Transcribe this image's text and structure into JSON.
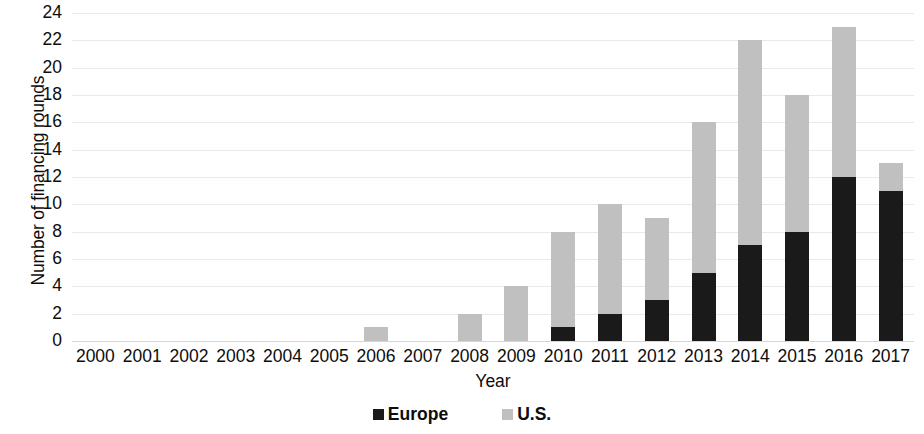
{
  "chart_data": {
    "type": "bar",
    "subtype": "stacked-bar",
    "title": "",
    "xlabel": "Year",
    "ylabel": "Number of financing rounds",
    "categories": [
      "2000",
      "2001",
      "2002",
      "2003",
      "2004",
      "2005",
      "2006",
      "2007",
      "2008",
      "2009",
      "2010",
      "2011",
      "2012",
      "2013",
      "2014",
      "2015",
      "2016",
      "2017"
    ],
    "series": [
      {
        "name": "Europe",
        "color": "#1a1a1a",
        "values": [
          0,
          0,
          0,
          0,
          0,
          0,
          0,
          0,
          0,
          0,
          1,
          2,
          3,
          5,
          7,
          8,
          12,
          11
        ]
      },
      {
        "name": "U.S.",
        "color": "#c0c0c0",
        "values": [
          0,
          0,
          0,
          0,
          0,
          0,
          1,
          0,
          2,
          4,
          7,
          8,
          6,
          11,
          15,
          10,
          11,
          2
        ]
      }
    ],
    "totals": [
      0,
      0,
      0,
      0,
      0,
      0,
      1,
      0,
      2,
      4,
      8,
      10,
      9,
      16,
      22,
      18,
      23,
      13
    ],
    "ylim": [
      0,
      24
    ],
    "ytick_step": 2,
    "yticks": [
      "24",
      "22",
      "20",
      "18",
      "16",
      "14",
      "12",
      "10",
      "8",
      "6",
      "4",
      "2",
      "0"
    ],
    "grid": true,
    "grid_axis": "y",
    "legend_position": "bottom",
    "legend": [
      {
        "label": "Europe",
        "color": "#1a1a1a"
      },
      {
        "label": "U.S.",
        "color": "#c0c0c0"
      }
    ]
  }
}
